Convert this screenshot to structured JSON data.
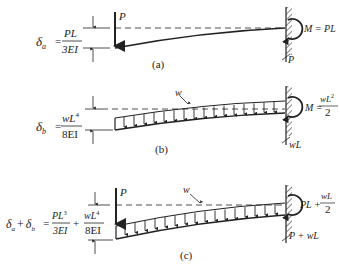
{
  "figure": {
    "panels": [
      {
        "id": "a",
        "caption": "(a)",
        "deflection_symbol": "δ",
        "deflection_sub": "a",
        "eq": "=",
        "num": "PL",
        "den": "3EI",
        "load_label": "P",
        "moment_label": "M = PL",
        "reaction_label": "P"
      },
      {
        "id": "b",
        "caption": "(b)",
        "deflection_symbol": "δ",
        "deflection_sub": "b",
        "eq": "=",
        "num": "wL",
        "num_sup": "4",
        "den": "8EI",
        "load_label": "w",
        "moment_prefix": "M =",
        "moment_num": "wL",
        "moment_sup": "2",
        "moment_den": "2",
        "reaction_label": "wL"
      },
      {
        "id": "c",
        "caption": "(c)",
        "lhs": "δ",
        "lhs_sub_a": "a",
        "plus": "+",
        "lhs_sub_b": "b",
        "eq": "=",
        "term1_num": "PL",
        "term1_sup": "3",
        "term1_den": "3EI",
        "term2_num": "wL",
        "term2_sup": "4",
        "term2_den": "8EI",
        "point_load_label": "P",
        "dist_load_label": "w",
        "moment_prefix": "PL +",
        "moment_num": "wL",
        "moment_den": "2",
        "reaction_label": "P + wL"
      }
    ]
  }
}
